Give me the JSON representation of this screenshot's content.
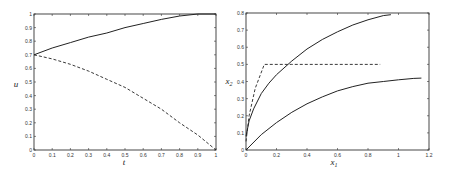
{
  "chart_data": [
    {
      "type": "line",
      "title": "",
      "xlabel": "t",
      "ylabel": "u",
      "xlim": [
        0,
        1
      ],
      "ylim": [
        0,
        1
      ],
      "xticks": [
        "0",
        "0.1",
        "0.2",
        "0.3",
        "0.4",
        "0.5",
        "0.6",
        "0.7",
        "0.8",
        "0.9",
        "1"
      ],
      "yticks": [
        "0",
        "0.1",
        "0.2",
        "0.3",
        "0.4",
        "0.5",
        "0.6",
        "0.7",
        "0.8",
        "0.9",
        "1"
      ],
      "grid": false,
      "series": [
        {
          "name": "upper (solid)",
          "style": "solid",
          "x": [
            0,
            0.1,
            0.2,
            0.3,
            0.4,
            0.5,
            0.6,
            0.7,
            0.8,
            0.9,
            1.0
          ],
          "y": [
            0.7,
            0.75,
            0.79,
            0.83,
            0.86,
            0.9,
            0.93,
            0.96,
            0.985,
            1.0,
            1.0
          ]
        },
        {
          "name": "lower (dashed)",
          "style": "dashed",
          "x": [
            0,
            0.1,
            0.2,
            0.3,
            0.4,
            0.5,
            0.6,
            0.7,
            0.8,
            0.9,
            1.0
          ],
          "y": [
            0.7,
            0.67,
            0.63,
            0.58,
            0.52,
            0.46,
            0.38,
            0.3,
            0.2,
            0.11,
            0.0
          ]
        }
      ]
    },
    {
      "type": "line",
      "title": "",
      "xlabel": "x1",
      "ylabel": "x2",
      "xlim": [
        0,
        1.2
      ],
      "ylim": [
        0,
        0.8
      ],
      "xticks": [
        "0",
        "0.2",
        "0.4",
        "0.6",
        "0.8",
        "1",
        "1.2"
      ],
      "yticks": [
        "0",
        "0.1",
        "0.2",
        "0.3",
        "0.4",
        "0.5",
        "0.6",
        "0.7",
        "0.8"
      ],
      "grid": false,
      "series": [
        {
          "name": "upper trajectory (solid)",
          "style": "solid",
          "x": [
            0,
            0.02,
            0.05,
            0.1,
            0.15,
            0.2,
            0.3,
            0.4,
            0.5,
            0.6,
            0.7,
            0.8,
            0.9,
            0.95
          ],
          "y": [
            0.08,
            0.17,
            0.24,
            0.33,
            0.39,
            0.44,
            0.52,
            0.59,
            0.645,
            0.69,
            0.73,
            0.76,
            0.785,
            0.79
          ]
        },
        {
          "name": "lower trajectory (solid)",
          "style": "solid",
          "x": [
            0,
            0.1,
            0.2,
            0.3,
            0.4,
            0.5,
            0.6,
            0.7,
            0.8,
            0.9,
            1.0,
            1.1,
            1.15
          ],
          "y": [
            0.0,
            0.09,
            0.16,
            0.22,
            0.27,
            0.31,
            0.345,
            0.37,
            0.39,
            0.4,
            0.41,
            0.418,
            0.42
          ]
        },
        {
          "name": "dashed path",
          "style": "dashed",
          "x": [
            0,
            0.02,
            0.06,
            0.12,
            0.3,
            0.5,
            0.7,
            0.88
          ],
          "y": [
            0.05,
            0.2,
            0.36,
            0.5,
            0.5,
            0.5,
            0.5,
            0.5
          ]
        }
      ]
    }
  ],
  "left_plot": {
    "xlabel": "t",
    "ylabel": "u",
    "xticks": [
      "0",
      "0.1",
      "0.2",
      "0.3",
      "0.4",
      "0.5",
      "0.6",
      "0.7",
      "0.8",
      "0.9",
      "1"
    ],
    "yticks": [
      "0",
      "0.1",
      "0.2",
      "0.3",
      "0.4",
      "0.5",
      "0.6",
      "0.7",
      "0.8",
      "0.9",
      "1"
    ]
  },
  "right_plot": {
    "xlabel": "x",
    "xlabel_sub": "1",
    "ylabel": "x",
    "ylabel_sub": "2",
    "xticks": [
      "0",
      "0.2",
      "0.4",
      "0.6",
      "0.8",
      "1",
      "1.2"
    ],
    "yticks": [
      "0",
      "0.1",
      "0.2",
      "0.3",
      "0.4",
      "0.5",
      "0.6",
      "0.7",
      "0.8"
    ]
  }
}
